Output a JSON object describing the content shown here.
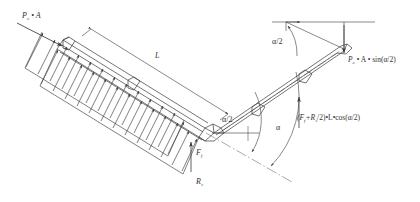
{
  "figure": {
    "kind": "free-body-diagram",
    "background_color": "#ffffff",
    "line_color": "#3a3a3a",
    "text_color": "#333333"
  },
  "labels": {
    "applied_pressure_force": "P",
    "applied_pressure_force_sub": "c",
    "applied_pressure_force_tail": " • A",
    "length_dimension": "L",
    "half_angle_left": "α/2",
    "half_angle_upper_right": "α/2",
    "full_angle": "α",
    "friction_force": "F",
    "friction_force_sub": "f",
    "support_reaction": "R",
    "support_reaction_sub": "s",
    "moment_expression_open": "(F",
    "moment_expression_sub1": "f",
    "moment_expression_mid": "+R",
    "moment_expression_sub2": "s",
    "moment_expression_tail": "/2)•L•cos(α/2)",
    "axial_component": "P",
    "axial_component_sub": "c",
    "axial_component_tail": " • A • sin(α/2)"
  },
  "elements": {
    "left_pipe": "left-pipe-segment",
    "right_pipe": "right-pipe-segment",
    "elbow_joint": "elbow-joint",
    "distributed_load": "distributed-load-arrows",
    "centerline": "centerline-dash-dot",
    "angle_arc_inner": "angle-arc-half",
    "angle_arc_outer": "angle-arc-full",
    "dimension_line_length": "dimension-line-L",
    "force_arrow_pressure": "force-arrow-pressure",
    "force_arrow_axial": "force-arrow-axial",
    "force_arrow_moment": "force-arrow-moment"
  }
}
